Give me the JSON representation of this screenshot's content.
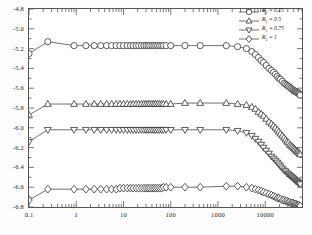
{
  "chart_data": {
    "type": "line",
    "title": "",
    "xlabel": "",
    "ylabel": "",
    "xscale": "log",
    "xlim": [
      0.1,
      60000
    ],
    "ylim": [
      -6.8,
      -4.8
    ],
    "grid": false,
    "legend_position": "top-right",
    "xticks": [
      "0.1",
      "1",
      "10",
      "100",
      "1000",
      "10000"
    ],
    "xtick_values": [
      0.1,
      1,
      10,
      100,
      1000,
      10000
    ],
    "yticks": [
      "-4.8",
      "-5.0",
      "-5.2",
      "-5.4",
      "-5.6",
      "-5.8",
      "-6.0",
      "-6.2",
      "-6.4",
      "-6.6",
      "-6.8"
    ],
    "ytick_values": [
      -4.8,
      -5.0,
      -5.2,
      -5.4,
      -5.6,
      -5.8,
      -6.0,
      -6.2,
      -6.4,
      -6.6,
      -6.8
    ],
    "series": [
      {
        "name": "R1 = 0.25",
        "marker": "circle",
        "color": "#333333",
        "x": [
          0.1,
          0.25,
          0.9,
          1.6,
          2.4,
          3.3,
          4.4,
          5.6,
          7.0,
          8.4,
          10.0,
          12.0,
          14.0,
          16.0,
          18.5,
          21.0,
          24.0,
          27.0,
          30.0,
          33.0,
          36.0,
          40.0,
          44.0,
          48.0,
          53.0,
          58.0,
          64.0,
          70.0,
          80.0,
          100.0,
          200.0,
          420.0,
          1500.0,
          2600.0,
          4000.0,
          5200.0,
          6200.0,
          7200.0,
          8200.0,
          9200.0,
          10500.0,
          12000.0,
          13500.0,
          15000.0,
          16500.0,
          18000.0,
          19500.0,
          21000.0,
          23000.0,
          25000.0,
          27000.0,
          29000.0,
          31000.0,
          33000.0,
          35000.0,
          37000.0,
          39000.0,
          41000.0,
          43000.0,
          45000.0,
          47000.0,
          49000.0,
          51000.0,
          53000.0,
          55000.0
        ],
        "y": [
          -5.25,
          -5.13,
          -5.17,
          -5.17,
          -5.17,
          -5.17,
          -5.17,
          -5.17,
          -5.17,
          -5.17,
          -5.17,
          -5.17,
          -5.17,
          -5.17,
          -5.17,
          -5.17,
          -5.17,
          -5.17,
          -5.17,
          -5.17,
          -5.17,
          -5.17,
          -5.17,
          -5.17,
          -5.17,
          -5.17,
          -5.17,
          -5.17,
          -5.17,
          -5.17,
          -5.17,
          -5.17,
          -5.17,
          -5.18,
          -5.2,
          -5.23,
          -5.26,
          -5.29,
          -5.32,
          -5.34,
          -5.37,
          -5.4,
          -5.42,
          -5.44,
          -5.46,
          -5.48,
          -5.5,
          -5.51,
          -5.53,
          -5.55,
          -5.56,
          -5.57,
          -5.58,
          -5.59,
          -5.6,
          -5.61,
          -5.62,
          -5.63,
          -5.63,
          -5.64,
          -5.64,
          -5.65,
          -5.65,
          -5.66,
          -5.67
        ]
      },
      {
        "name": "R1 = 0.5",
        "marker": "triangle-up",
        "color": "#333333",
        "x": [
          0.1,
          0.25,
          0.9,
          1.6,
          2.4,
          3.3,
          4.4,
          5.6,
          7.0,
          8.4,
          10.0,
          12.0,
          14.0,
          16.0,
          18.5,
          21.0,
          24.0,
          27.0,
          30.0,
          33.0,
          36.0,
          40.0,
          44.0,
          48.0,
          53.0,
          58.0,
          64.0,
          70.0,
          80.0,
          100.0,
          200.0,
          420.0,
          1500.0,
          2600.0,
          4000.0,
          5200.0,
          6200.0,
          7200.0,
          8200.0,
          9200.0,
          10500.0,
          12000.0,
          13500.0,
          15000.0,
          16500.0,
          18000.0,
          19500.0,
          21000.0,
          23000.0,
          25000.0,
          27000.0,
          29000.0,
          31000.0,
          33000.0,
          35000.0,
          37000.0,
          39000.0,
          41000.0,
          43000.0,
          45000.0,
          47000.0,
          49000.0,
          51000.0,
          53000.0,
          55000.0
        ],
        "y": [
          -5.87,
          -5.76,
          -5.76,
          -5.76,
          -5.76,
          -5.76,
          -5.76,
          -5.76,
          -5.76,
          -5.76,
          -5.76,
          -5.76,
          -5.76,
          -5.76,
          -5.76,
          -5.76,
          -5.76,
          -5.76,
          -5.76,
          -5.76,
          -5.76,
          -5.76,
          -5.76,
          -5.76,
          -5.76,
          -5.76,
          -5.76,
          -5.76,
          -5.76,
          -5.76,
          -5.75,
          -5.75,
          -5.75,
          -5.76,
          -5.77,
          -5.79,
          -5.81,
          -5.84,
          -5.86,
          -5.88,
          -5.91,
          -5.94,
          -5.96,
          -5.98,
          -6.0,
          -6.02,
          -6.04,
          -6.06,
          -6.08,
          -6.1,
          -6.12,
          -6.14,
          -6.15,
          -6.17,
          -6.18,
          -6.19,
          -6.2,
          -6.21,
          -6.22,
          -6.23,
          -6.24,
          -6.24,
          -6.25,
          -6.26,
          -6.27
        ]
      },
      {
        "name": "R1 = 0.75",
        "marker": "triangle-down",
        "color": "#333333",
        "x": [
          0.1,
          0.25,
          0.9,
          1.6,
          2.4,
          3.3,
          4.4,
          5.6,
          7.0,
          8.4,
          10.0,
          12.0,
          14.0,
          16.0,
          18.5,
          21.0,
          24.0,
          27.0,
          30.0,
          33.0,
          36.0,
          40.0,
          44.0,
          48.0,
          53.0,
          58.0,
          64.0,
          70.0,
          80.0,
          100.0,
          200.0,
          420.0,
          1500.0,
          2600.0,
          4000.0,
          5200.0,
          6200.0,
          7200.0,
          8200.0,
          9200.0,
          10500.0,
          12000.0,
          13500.0,
          15000.0,
          16500.0,
          18000.0,
          19500.0,
          21000.0,
          23000.0,
          25000.0,
          27000.0,
          29000.0,
          31000.0,
          33000.0,
          35000.0,
          37000.0,
          39000.0,
          41000.0,
          43000.0,
          45000.0,
          47000.0,
          49000.0,
          51000.0,
          53000.0,
          55000.0
        ],
        "y": [
          -6.14,
          -6.02,
          -6.02,
          -6.02,
          -6.02,
          -6.02,
          -6.02,
          -6.02,
          -6.02,
          -6.02,
          -6.02,
          -6.02,
          -6.02,
          -6.02,
          -6.02,
          -6.02,
          -6.02,
          -6.02,
          -6.02,
          -6.02,
          -6.02,
          -6.02,
          -6.02,
          -6.02,
          -6.02,
          -6.02,
          -6.02,
          -6.02,
          -6.02,
          -6.02,
          -6.02,
          -6.02,
          -6.02,
          -6.03,
          -6.05,
          -6.08,
          -6.11,
          -6.14,
          -6.17,
          -6.2,
          -6.23,
          -6.26,
          -6.29,
          -6.31,
          -6.33,
          -6.35,
          -6.37,
          -6.39,
          -6.41,
          -6.43,
          -6.44,
          -6.46,
          -6.47,
          -6.48,
          -6.49,
          -6.5,
          -6.51,
          -6.52,
          -6.53,
          -6.54,
          -6.54,
          -6.55,
          -6.56,
          -6.56,
          -6.57
        ]
      },
      {
        "name": "R1 = 1",
        "marker": "diamond",
        "color": "#333333",
        "x": [
          0.1,
          0.25,
          0.9,
          1.6,
          2.4,
          3.3,
          4.4,
          5.6,
          7.0,
          8.4,
          10.0,
          12.0,
          14.0,
          16.0,
          18.5,
          21.0,
          24.0,
          27.0,
          30.0,
          33.0,
          36.0,
          40.0,
          44.0,
          48.0,
          53.0,
          58.0,
          64.0,
          70.0,
          80.0,
          100.0,
          200.0,
          420.0,
          1500.0,
          2600.0,
          4000.0,
          5200.0,
          6200.0,
          7200.0,
          8200.0,
          9200.0,
          10500.0,
          12000.0,
          13500.0,
          15000.0,
          16500.0,
          18000.0,
          19500.0,
          21000.0,
          23000.0,
          25000.0,
          27000.0,
          29000.0,
          31000.0,
          33000.0,
          35000.0,
          37000.0,
          39000.0,
          41000.0,
          43000.0,
          45000.0,
          47000.0,
          49000.0,
          51000.0,
          53000.0,
          55000.0
        ],
        "y": [
          -6.73,
          -6.62,
          -6.62,
          -6.62,
          -6.62,
          -6.62,
          -6.62,
          -6.62,
          -6.62,
          -6.61,
          -6.61,
          -6.61,
          -6.61,
          -6.61,
          -6.61,
          -6.61,
          -6.61,
          -6.61,
          -6.61,
          -6.61,
          -6.61,
          -6.61,
          -6.61,
          -6.61,
          -6.61,
          -6.61,
          -6.61,
          -6.6,
          -6.6,
          -6.6,
          -6.6,
          -6.6,
          -6.59,
          -6.59,
          -6.6,
          -6.61,
          -6.62,
          -6.63,
          -6.64,
          -6.65,
          -6.66,
          -6.67,
          -6.68,
          -6.69,
          -6.7,
          -6.71,
          -6.71,
          -6.72,
          -6.73,
          -6.73,
          -6.74,
          -6.74,
          -6.75,
          -6.75,
          -6.76,
          -6.76,
          -6.76,
          -6.77,
          -6.77,
          -6.77,
          -6.78,
          -6.78,
          -6.78,
          -6.79,
          -6.79
        ]
      }
    ]
  },
  "legend": {
    "entries": [
      {
        "prefix": "R",
        "sub": "1",
        "value": " = 0.25"
      },
      {
        "prefix": "R",
        "sub": "1",
        "value": " = 0.5"
      },
      {
        "prefix": "R",
        "sub": "1",
        "value": " = 0.75"
      },
      {
        "prefix": "R",
        "sub": "1",
        "value": " = 1"
      }
    ]
  }
}
